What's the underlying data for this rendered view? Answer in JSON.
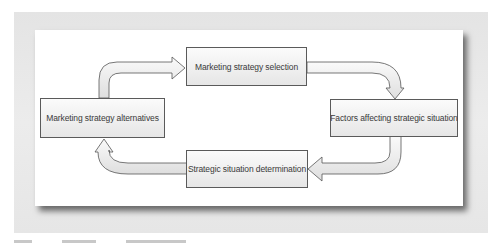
{
  "diagram": {
    "type": "cycle-flow",
    "nodes": [
      {
        "id": "selection",
        "label": "Marketing strategy selection"
      },
      {
        "id": "factors",
        "label": "Factors affecting strategic situation"
      },
      {
        "id": "determination",
        "label": "Strategic situation determination"
      },
      {
        "id": "alternatives",
        "label": "Marketing strategy alternatives"
      }
    ],
    "edges": [
      {
        "from": "alternatives",
        "to": "selection"
      },
      {
        "from": "selection",
        "to": "factors"
      },
      {
        "from": "factors",
        "to": "determination"
      },
      {
        "from": "determination",
        "to": "alternatives"
      }
    ]
  },
  "caption": {
    "visible": "partial",
    "text": ""
  },
  "colors": {
    "box_border": "#5a5a5a",
    "arrow_fill": "#f0f0f0",
    "arrow_stroke": "#555555",
    "frame": "#e6e6e6"
  }
}
